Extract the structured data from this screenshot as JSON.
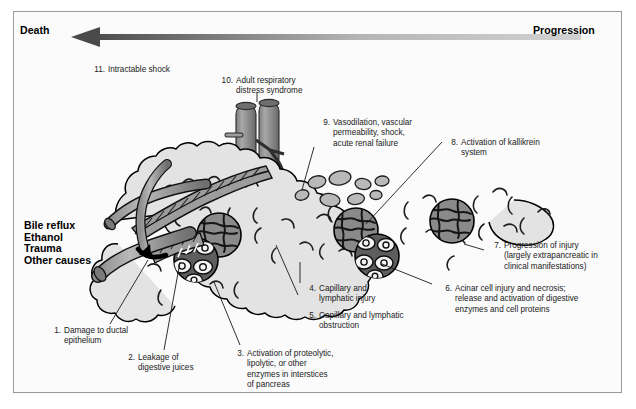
{
  "figure": {
    "title_left": "Death",
    "title_right": "Progression",
    "causes_label": "Bile reflux\nEthanol\nTrauma\nOther causes",
    "arrow": {
      "direction": "left",
      "dark_color": "#4a4a4a",
      "light_color": "#c9c9c9",
      "label_left": "Death",
      "label_right": "Progression"
    },
    "panel": {
      "background": "#fbfbfb",
      "border_color": "#9a9a9a"
    },
    "colors": {
      "organ_fill": "#e3e3e3",
      "organ_outline": "#000000",
      "vessel_fill": "#b3b3b3",
      "vessel_dark": "#7d7d7d",
      "necrosis_fill": "#8c8c8c",
      "duct_fill": "#9e9e9e",
      "edema_fill": "#c4c4c4"
    },
    "steps": [
      {
        "num": "1.",
        "text": "Damage to ductal\nepithelium",
        "x": 31,
        "y": 314
      },
      {
        "num": "2.",
        "text": "Leakage of\ndigestive juices",
        "x": 105,
        "y": 341
      },
      {
        "num": "3.",
        "text": "Activation of proteolytic,\nlipolytic, or other\nenzymes in interstices\nof pancreas",
        "x": 216,
        "y": 337
      },
      {
        "num": "4.",
        "text": "Capillary and\nlymphatic injury",
        "x": 288,
        "y": 272
      },
      {
        "num": "5.",
        "text": "Capillary and lymphatic\nobstruction",
        "x": 288,
        "y": 299
      },
      {
        "num": "6.",
        "text": "Acinar cell injury and necrosis;\nrelease and activation of digestive\nenzymes and cell proteins",
        "x": 424,
        "y": 272
      },
      {
        "num": "7.",
        "text": "Progression of injury\n   (largely extrapancreatic in\n     clinical manifestations)",
        "x": 473,
        "y": 229
      },
      {
        "num": "8.",
        "text": "Activation of kallikrein\nsystem",
        "x": 430,
        "y": 126
      },
      {
        "num": "9.",
        "text": "Vasodilation, vascular\npermeability, shock,\nacute renal failure",
        "x": 302,
        "y": 106
      },
      {
        "num": "10.",
        "text": "Adult respiratory\ndistress syndrome",
        "x": 212,
        "y": 64
      },
      {
        "num": "11.",
        "text": "Intractable shock",
        "x": 84,
        "y": 53
      }
    ]
  }
}
